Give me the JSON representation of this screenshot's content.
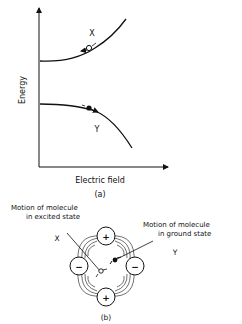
{
  "panel_a": {
    "y_axis_label": "Energy",
    "x_axis_label": "Electric field",
    "caption": "(a)",
    "curve_upper_label": "X",
    "curve_lower_label": "Y",
    "upper_marker": "open-circle",
    "lower_marker": "filled-circle"
  },
  "panel_b": {
    "caption": "(b)",
    "label_x": "X",
    "label_y": "Y",
    "annotation_excited_line1": "Motion of molecule",
    "annotation_excited_line2": "in excited state",
    "annotation_ground_line1": "Motion of molecule",
    "annotation_ground_line2": "in ground state",
    "charges": {
      "top": "+",
      "bottom": "+",
      "left": "−",
      "right": "−"
    }
  }
}
